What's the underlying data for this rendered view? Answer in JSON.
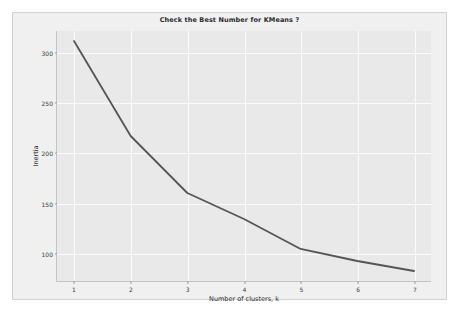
{
  "chart_data": {
    "type": "line",
    "title": "Check the Best Number for KMeans ?",
    "xlabel": "Number of clusters, k",
    "ylabel": "Inertia",
    "x": [
      1,
      2,
      3,
      4,
      5,
      6,
      7
    ],
    "values": [
      312,
      217,
      160,
      134,
      104,
      92,
      82
    ],
    "series": [
      {
        "name": "Inertia",
        "values": [
          312,
          217,
          160,
          134,
          104,
          92,
          82
        ]
      }
    ],
    "xtick_labels": [
      "1",
      "2",
      "3",
      "4",
      "5",
      "6",
      "7"
    ],
    "ytick_labels": [
      "100",
      "150",
      "200",
      "250",
      "300"
    ],
    "ytick_values": [
      100,
      150,
      200,
      250,
      300
    ],
    "xlim": [
      0.7,
      7.3
    ],
    "ylim": [
      72,
      322
    ],
    "grid": true,
    "legend": null,
    "line_color": "#555555",
    "plot_background": "#e9e9e9",
    "figure_background": "#f0f0f0",
    "grid_color": "#fbfbfb"
  }
}
